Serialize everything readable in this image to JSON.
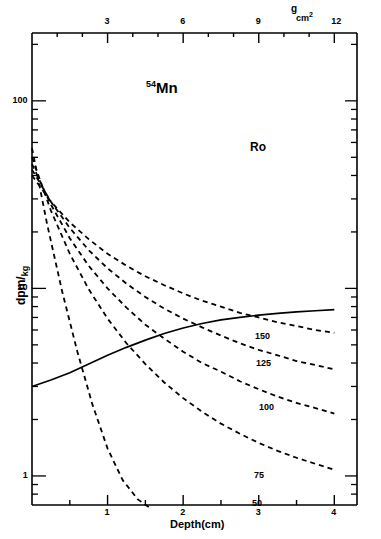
{
  "figure": {
    "isotope_sup": "54",
    "isotope_name": "Mn",
    "annotation_ro": "Ro"
  },
  "axes": {
    "bottom": {
      "title": "Depth(cm)",
      "ticks": [
        "1",
        "2",
        "3",
        "4"
      ],
      "range": [
        0,
        4.3
      ]
    },
    "top": {
      "title_numerator": "g",
      "title_denominator": "cm",
      "title_denominator_sup": "2",
      "ticks": [
        "3",
        "6",
        "9",
        "12"
      ],
      "range": [
        0,
        12.9
      ]
    },
    "left": {
      "title_main": "dpm",
      "title_slash": "/",
      "title_sub": "kg",
      "ticks": [
        "100",
        "10",
        "1"
      ],
      "scale": "log",
      "range": [
        0.7,
        230
      ]
    }
  },
  "curve_labels": [
    {
      "text": "150",
      "x": 255,
      "y": 332
    },
    {
      "text": "125",
      "x": 256,
      "y": 359
    },
    {
      "text": "100",
      "x": 259,
      "y": 403
    },
    {
      "text": "75",
      "x": 254,
      "y": 471
    },
    {
      "text": "50",
      "x": 252,
      "y": 499
    }
  ],
  "chart_data": {
    "type": "line",
    "xlabel": "Depth(cm)",
    "ylabel": "dpm/kg",
    "xlim": [
      0,
      4.3
    ],
    "ylim": [
      0.7,
      230
    ],
    "yscale": "log",
    "grid": false,
    "legend": "inline-curve-labels",
    "secondary_xaxis": {
      "label": "g/cm2",
      "xlim": [
        0,
        12.9
      ],
      "ticks": [
        3,
        6,
        9,
        12
      ]
    },
    "annotations": [
      {
        "text": "54Mn",
        "x": 1.2,
        "y": 150
      },
      {
        "text": "Ro",
        "x": 2.7,
        "y": 72
      }
    ],
    "series": [
      {
        "name": "measured",
        "style": "solid",
        "x": [
          0.0,
          0.25,
          0.5,
          0.75,
          1.0,
          1.25,
          1.5,
          1.75,
          2.0,
          2.25,
          2.5,
          2.75,
          3.0,
          3.25,
          3.5,
          3.75,
          4.0
        ],
        "y": [
          3.0,
          3.25,
          3.55,
          3.95,
          4.4,
          4.85,
          5.3,
          5.75,
          6.15,
          6.5,
          6.8,
          7.0,
          7.2,
          7.35,
          7.5,
          7.6,
          7.7
        ]
      },
      {
        "name": "150",
        "style": "dashed",
        "x": [
          0.0,
          0.25,
          0.5,
          0.75,
          1.0,
          1.25,
          1.5,
          1.75,
          2.0,
          2.25,
          2.5,
          2.75,
          3.0,
          3.25,
          3.5,
          3.75,
          4.0
        ],
        "y": [
          40.0,
          29.0,
          22.5,
          18.3,
          15.3,
          13.2,
          11.6,
          10.4,
          9.4,
          8.6,
          8.0,
          7.4,
          7.0,
          6.6,
          6.3,
          6.0,
          5.8
        ]
      },
      {
        "name": "125",
        "style": "dashed",
        "x": [
          0.0,
          0.25,
          0.5,
          0.75,
          1.0,
          1.25,
          1.5,
          1.75,
          2.0,
          2.25,
          2.5,
          2.75,
          3.0,
          3.25,
          3.5,
          3.75,
          4.0
        ],
        "y": [
          43.0,
          29.0,
          21.0,
          16.0,
          12.8,
          10.6,
          9.0,
          7.8,
          6.9,
          6.2,
          5.6,
          5.1,
          4.7,
          4.4,
          4.1,
          3.9,
          3.7
        ]
      },
      {
        "name": "100",
        "style": "dashed",
        "x": [
          0.0,
          0.25,
          0.5,
          0.75,
          1.0,
          1.25,
          1.5,
          1.75,
          2.0,
          2.25,
          2.5,
          2.75,
          3.0,
          3.25,
          3.5,
          3.75,
          4.0
        ],
        "y": [
          46.0,
          28.0,
          18.5,
          13.2,
          10.0,
          7.9,
          6.4,
          5.4,
          4.6,
          4.0,
          3.6,
          3.2,
          2.9,
          2.65,
          2.45,
          2.3,
          2.15
        ]
      },
      {
        "name": "75",
        "style": "dashed",
        "x": [
          0.0,
          0.25,
          0.5,
          0.75,
          1.0,
          1.25,
          1.5,
          1.75,
          2.0,
          2.25,
          2.5,
          2.75,
          3.0,
          3.25,
          3.5,
          3.75,
          4.0
        ],
        "y": [
          50.0,
          26.0,
          15.3,
          9.9,
          6.9,
          5.1,
          3.95,
          3.15,
          2.6,
          2.2,
          1.9,
          1.68,
          1.5,
          1.36,
          1.25,
          1.16,
          1.08
        ]
      },
      {
        "name": "50",
        "style": "dashed",
        "x": [
          0.0,
          0.2,
          0.4,
          0.6,
          0.8,
          1.0,
          1.2,
          1.4,
          1.55
        ],
        "y": [
          56.0,
          22.0,
          9.6,
          4.6,
          2.4,
          1.4,
          0.95,
          0.75,
          0.68
        ]
      }
    ]
  }
}
